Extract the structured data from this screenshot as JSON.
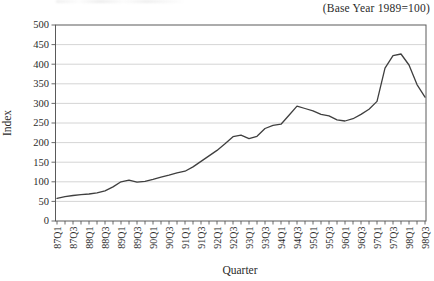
{
  "header": {
    "base_year_note": "(Base Year 1989=100)"
  },
  "chart_data": {
    "type": "line",
    "title": "",
    "xlabel": "Quarter",
    "ylabel": "Index",
    "ylim": [
      0,
      500
    ],
    "ytick_step": 50,
    "grid": true,
    "legend_shown": false,
    "x_label_every_n": 2,
    "categories": [
      "87Q1",
      "87Q2",
      "87Q3",
      "87Q4",
      "88Q1",
      "88Q2",
      "88Q3",
      "88Q4",
      "89Q1",
      "89Q2",
      "89Q3",
      "89Q4",
      "90Q1",
      "90Q2",
      "90Q3",
      "90Q4",
      "91Q1",
      "91Q2",
      "91Q3",
      "91Q4",
      "92Q1",
      "92Q2",
      "92Q3",
      "92Q4",
      "93Q1",
      "93Q2",
      "93Q3",
      "93Q4",
      "94Q1",
      "94Q2",
      "94Q3",
      "94Q4",
      "95Q1",
      "95Q2",
      "95Q3",
      "95Q4",
      "96Q1",
      "96Q2",
      "96Q3",
      "96Q4",
      "97Q1",
      "97Q2",
      "97Q3",
      "97Q4",
      "98Q1",
      "98Q2",
      "98Q3"
    ],
    "values": [
      58,
      62,
      65,
      67,
      69,
      72,
      77,
      87,
      100,
      104,
      99,
      101,
      106,
      112,
      117,
      123,
      127,
      138,
      152,
      166,
      180,
      197,
      215,
      219,
      210,
      216,
      236,
      244,
      247,
      270,
      293,
      287,
      281,
      272,
      268,
      258,
      255,
      261,
      272,
      285,
      305,
      390,
      422,
      426,
      398,
      348,
      316
    ],
    "colors": {
      "line": "#3f3f3f",
      "grid": "#c9c9c9",
      "frame": "#5a5a5a",
      "text": "#2b2b2b"
    }
  }
}
